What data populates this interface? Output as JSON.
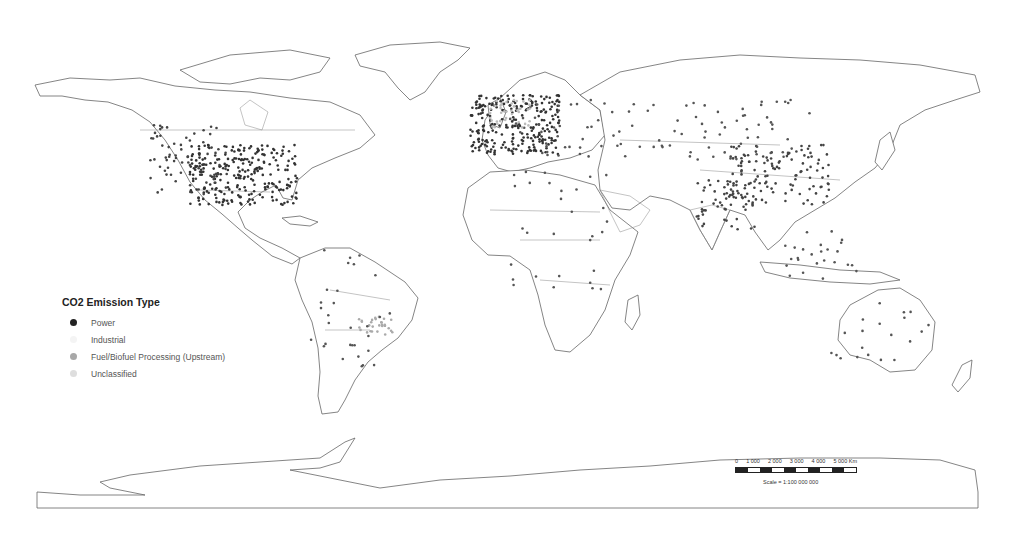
{
  "map": {
    "type": "world emission source point map",
    "projection": "equirectangular"
  },
  "legend": {
    "title": "CO2 Emission Type",
    "items": [
      {
        "label": "Power",
        "color": "#222222"
      },
      {
        "label": "Industrial",
        "color": "#f4f4f4"
      },
      {
        "label": "Fuel/Biofuel Processing (Upstream)",
        "color": "#a8a8a8"
      },
      {
        "label": "Unclassified",
        "color": "#dedede"
      }
    ]
  },
  "scale_bar": {
    "ticks": [
      "0",
      "1 000",
      "2 000",
      "3 000",
      "4 000",
      "5 000"
    ],
    "unit": "Km",
    "ratio_label": "Scale =",
    "ratio_value": "1:100 000 000"
  }
}
